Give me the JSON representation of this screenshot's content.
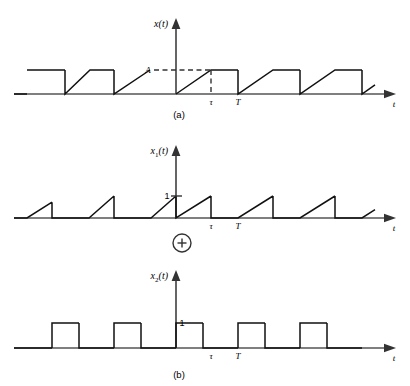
{
  "figure": {
    "captions": [
      {
        "id": "caption-a",
        "text": "(a)",
        "x": 179,
        "y": 118
      },
      {
        "id": "caption-b",
        "text": "(b)",
        "x": 179,
        "y": 378
      }
    ],
    "operator": {
      "name": "plus-operator",
      "symbol": "+",
      "cx": 182,
      "cy": 243,
      "r": 9
    },
    "colors": {
      "wave": "#111111",
      "axis": "#555555",
      "dashed": "#333333",
      "background": "#ffffff"
    },
    "geometry": {
      "origin_x": 176,
      "tau_x": 211,
      "period_T_x": 238,
      "plot_left": 14,
      "plot_right": 398,
      "arrow_tip_x": 396
    }
  },
  "chart_data": [
    {
      "type": "line",
      "name": "plot-a",
      "title": "x(t)",
      "ylabel": "x(t)",
      "xlabel": "t",
      "baseline_y": 94,
      "amplitude_y": 70,
      "axis_top_y": 18,
      "level_labels": [
        {
          "id": "level-A",
          "text": "A",
          "value": "A",
          "x": 148,
          "y": 73
        }
      ],
      "tick_labels": [
        {
          "id": "tick-tau",
          "text": "τ",
          "x": 211,
          "y": 105
        },
        {
          "id": "tick-T",
          "text": "T",
          "x": 238,
          "y": 105
        }
      ],
      "dashed_guides": [
        {
          "id": "guide-A-horizontal",
          "x1": 154,
          "y1": 70,
          "x2": 212,
          "y2": 70
        },
        {
          "id": "guide-tau-vertical",
          "x1": 211,
          "y1": 70,
          "x2": 211,
          "y2": 94
        }
      ],
      "description": "Periodic waveform: linear ramp from 0 up to A over [0, tau], flat hold at A over [tau, T], then instantaneous drop to 0 at T.",
      "period_px": 62,
      "ramp_px": 35,
      "segments_px": [
        {
          "type": "hold",
          "x1": 14,
          "x2": 27,
          "level": 0
        },
        {
          "type": "hold",
          "x1": 27,
          "x2": 65,
          "level": 1
        },
        {
          "type": "drop",
          "x": 65
        },
        {
          "type": "ramp",
          "x1": 65,
          "x2": 90,
          "from": 0,
          "to": 1
        },
        {
          "type": "hold",
          "x1": 90,
          "x2": 114,
          "level": 1
        },
        {
          "type": "drop",
          "x": 114
        },
        {
          "type": "ramp",
          "x1": 114,
          "x2": 150,
          "from": 0,
          "to": 1
        },
        {
          "type": "ramp",
          "x1": 176,
          "x2": 211,
          "from": 0,
          "to": 1
        },
        {
          "type": "hold",
          "x1": 211,
          "x2": 238,
          "level": 1
        },
        {
          "type": "drop",
          "x": 238
        },
        {
          "type": "ramp",
          "x1": 238,
          "x2": 273,
          "from": 0,
          "to": 1
        },
        {
          "type": "hold",
          "x1": 273,
          "x2": 300,
          "level": 1
        },
        {
          "type": "drop",
          "x": 300
        },
        {
          "type": "ramp",
          "x1": 300,
          "x2": 335,
          "from": 0,
          "to": 1
        },
        {
          "type": "hold",
          "x1": 335,
          "x2": 362,
          "level": 1
        },
        {
          "type": "drop",
          "x": 362
        },
        {
          "type": "stub",
          "x1": 362,
          "x2": 375,
          "from": 0,
          "to": 0.38
        }
      ]
    },
    {
      "type": "line",
      "name": "plot-x1",
      "title": "x_1(t)",
      "ylabel": "x₁(t)",
      "xlabel": "t",
      "baseline_y": 218,
      "amplitude_y": 196,
      "axis_top_y": 145,
      "level_labels": [
        {
          "id": "level-1",
          "text": "1",
          "value": "1",
          "x": 167,
          "y": 199
        }
      ],
      "tick_labels": [
        {
          "id": "tick-tau",
          "text": "τ",
          "x": 211,
          "y": 229
        },
        {
          "id": "tick-T",
          "text": "T",
          "x": 238,
          "y": 229
        }
      ],
      "y_ticks": [
        {
          "id": "ytick-1",
          "y": 196,
          "x1": 171,
          "x2": 182
        }
      ],
      "description": "Sawtooth component: linear ramp from 0 to 1 over [0, tau], immediate drop to 0 at tau, zero until T, then repeats with period T.",
      "period_px": 62,
      "ramp_px": 35,
      "segments_px": [
        {
          "type": "hold",
          "x1": 14,
          "x2": 27,
          "level": 0
        },
        {
          "type": "ramp",
          "x1": 27,
          "x2": 52,
          "from": 0,
          "to": 0.72
        },
        {
          "type": "drop",
          "x": 52
        },
        {
          "type": "hold",
          "x1": 52,
          "x2": 89,
          "level": 0
        },
        {
          "type": "ramp",
          "x1": 89,
          "x2": 114,
          "from": 0,
          "to": 1
        },
        {
          "type": "drop",
          "x": 114
        },
        {
          "type": "hold",
          "x1": 114,
          "x2": 151,
          "level": 0
        },
        {
          "type": "ramp",
          "x1": 151,
          "x2": 176,
          "from": 0,
          "to": 1
        },
        {
          "type": "drop",
          "x": 176
        },
        {
          "type": "ramp",
          "x1": 176,
          "x2": 211,
          "from": 0,
          "to": 1
        },
        {
          "type": "drop",
          "x": 211
        },
        {
          "type": "hold",
          "x1": 211,
          "x2": 238,
          "level": 0
        },
        {
          "type": "ramp",
          "x1": 238,
          "x2": 273,
          "from": 0,
          "to": 1
        },
        {
          "type": "drop",
          "x": 273
        },
        {
          "type": "hold",
          "x1": 273,
          "x2": 300,
          "level": 0
        },
        {
          "type": "ramp",
          "x1": 300,
          "x2": 335,
          "from": 0,
          "to": 1
        },
        {
          "type": "drop",
          "x": 335
        },
        {
          "type": "hold",
          "x1": 335,
          "x2": 362,
          "level": 0
        },
        {
          "type": "stub",
          "x1": 362,
          "x2": 375,
          "from": 0,
          "to": 0.38
        }
      ]
    },
    {
      "type": "line",
      "name": "plot-x2",
      "title": "x_2(t)",
      "ylabel": "x₂(t)",
      "xlabel": "t",
      "baseline_y": 348,
      "amplitude_y": 323,
      "axis_top_y": 270,
      "level_labels": [
        {
          "id": "level-1",
          "text": "1",
          "value": "1",
          "x": 182,
          "y": 326
        }
      ],
      "tick_labels": [
        {
          "id": "tick-tau",
          "text": "τ",
          "x": 211,
          "y": 359
        },
        {
          "id": "tick-T",
          "text": "T",
          "x": 238,
          "y": 359
        }
      ],
      "description": "Rectangular pulse train component: value 1 over [tau, T], value 0 over [0, tau], repeating with period T.",
      "period_px": 62,
      "pulse_width_px": 27,
      "segments_px": [
        {
          "type": "hold",
          "x1": 14,
          "x2": 52,
          "level": 0
        },
        {
          "type": "rise",
          "x": 52
        },
        {
          "type": "hold",
          "x1": 52,
          "x2": 79,
          "level": 1
        },
        {
          "type": "drop",
          "x": 79
        },
        {
          "type": "hold",
          "x1": 79,
          "x2": 114,
          "level": 0
        },
        {
          "type": "rise",
          "x": 114
        },
        {
          "type": "hold",
          "x1": 114,
          "x2": 141,
          "level": 1
        },
        {
          "type": "drop",
          "x": 141
        },
        {
          "type": "hold",
          "x1": 141,
          "x2": 176,
          "level": 0
        },
        {
          "type": "rise",
          "x": 176
        },
        {
          "type": "hold",
          "x1": 176,
          "x2": 203,
          "level": 1
        },
        {
          "type": "drop",
          "x": 203
        },
        {
          "type": "hold",
          "x1": 203,
          "x2": 238,
          "level": 0
        },
        {
          "type": "rise",
          "x": 238
        },
        {
          "type": "hold",
          "x1": 238,
          "x2": 265,
          "level": 1
        },
        {
          "type": "drop",
          "x": 265
        },
        {
          "type": "hold",
          "x1": 265,
          "x2": 300,
          "level": 0
        },
        {
          "type": "rise",
          "x": 300
        },
        {
          "type": "hold",
          "x1": 300,
          "x2": 327,
          "level": 1
        },
        {
          "type": "drop",
          "x": 327
        },
        {
          "type": "hold",
          "x1": 327,
          "x2": 362,
          "level": 0
        }
      ]
    }
  ]
}
